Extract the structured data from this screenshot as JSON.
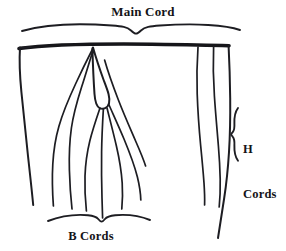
{
  "figure": {
    "name": "cord-assembly-diagram",
    "background_color": "#ffffff",
    "ink_color": "#1d1d22",
    "width": 286,
    "height": 251
  },
  "labels": {
    "main_cord": "Main Cord",
    "b_cords": "B Cords",
    "h_cords_line1": "H",
    "h_cords_line2": "Cords"
  },
  "annotations": {
    "top_brace_name": "main-cord-brace",
    "bottom_brace_name": "b-cords-brace",
    "right_brace_name": "h-cords-brace"
  },
  "parts": {
    "main_cord_bar": "horizontal main cord",
    "left_edge_cord": "left hanging cord",
    "right_edge_cord": "right hanging cord",
    "loop": "teardrop loop at attachment point",
    "b_cord_count": 6,
    "h_cord_count": 2
  }
}
